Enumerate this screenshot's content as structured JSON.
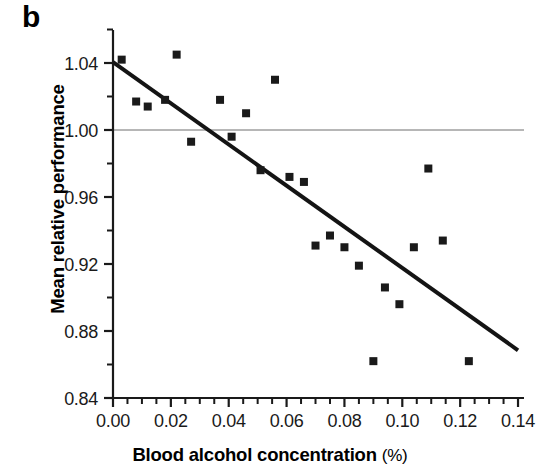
{
  "panel": {
    "label": "b"
  },
  "chart_data": {
    "type": "scatter",
    "title": "",
    "xlabel": "Blood alcohol concentration (%)",
    "xlabel_main": "Blood alcohol concentration",
    "xlabel_unit": "(%)",
    "ylabel": "Mean relative performance",
    "xlim": [
      0.0,
      0.14
    ],
    "ylim": [
      0.84,
      1.06
    ],
    "xticks": [
      0.0,
      0.02,
      0.04,
      0.06,
      0.08,
      0.1,
      0.12,
      0.14
    ],
    "xtick_labels": [
      "0.00",
      "0.02",
      "0.04",
      "0.06",
      "0.08",
      "0.10",
      "0.12",
      "0.14"
    ],
    "x_minor_step": 0.005,
    "yticks": [
      0.84,
      0.88,
      0.92,
      0.96,
      1.0,
      1.04
    ],
    "ytick_labels": [
      "0.84",
      "0.88",
      "0.92",
      "0.96",
      "1.00",
      "1.04"
    ],
    "y_minor_step": 0.02,
    "grid": false,
    "legend": null,
    "marker": {
      "shape": "square",
      "color": "#1a1a1a",
      "size": 8
    },
    "points": [
      {
        "x": 0.003,
        "y": 1.042
      },
      {
        "x": 0.008,
        "y": 1.017
      },
      {
        "x": 0.012,
        "y": 1.014
      },
      {
        "x": 0.018,
        "y": 1.018
      },
      {
        "x": 0.022,
        "y": 1.045
      },
      {
        "x": 0.027,
        "y": 0.993
      },
      {
        "x": 0.037,
        "y": 1.018
      },
      {
        "x": 0.041,
        "y": 0.996
      },
      {
        "x": 0.046,
        "y": 1.01
      },
      {
        "x": 0.051,
        "y": 0.976
      },
      {
        "x": 0.056,
        "y": 1.03
      },
      {
        "x": 0.061,
        "y": 0.972
      },
      {
        "x": 0.066,
        "y": 0.969
      },
      {
        "x": 0.07,
        "y": 0.931
      },
      {
        "x": 0.075,
        "y": 0.937
      },
      {
        "x": 0.08,
        "y": 0.93
      },
      {
        "x": 0.085,
        "y": 0.919
      },
      {
        "x": 0.09,
        "y": 0.862
      },
      {
        "x": 0.094,
        "y": 0.906
      },
      {
        "x": 0.099,
        "y": 0.896
      },
      {
        "x": 0.104,
        "y": 0.93
      },
      {
        "x": 0.109,
        "y": 0.977
      },
      {
        "x": 0.114,
        "y": 0.934
      },
      {
        "x": 0.123,
        "y": 0.862
      }
    ],
    "trend_line": {
      "name": "regression-line",
      "x_start": 0.0,
      "y_start": 1.0405,
      "x_end": 0.14,
      "y_end": 0.8685,
      "color": "#141414",
      "width": 4
    },
    "reference_line": {
      "name": "baseline-1.00",
      "y": 1.0,
      "color": "#6e6e6e",
      "width": 1
    },
    "axis_color": "#1a1a1a"
  }
}
